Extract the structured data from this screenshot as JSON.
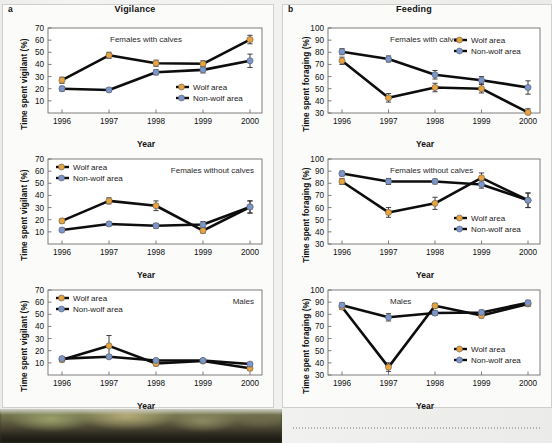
{
  "figure": {
    "columns": [
      {
        "letter": "a",
        "title": "Vigilance",
        "ylabel": "Time spent vigilant (%)",
        "xlabel": "Year"
      },
      {
        "letter": "b",
        "title": "Feeding",
        "ylabel": "Time spent foraging (%)",
        "xlabel": "Year"
      }
    ],
    "legend": {
      "wolf_label": "Wolf area",
      "nonwolf_label": "Non-wolf area",
      "wolf_color": "#e8a33d",
      "nonwolf_color": "#7b96cd",
      "line_color": "#0d0d0d"
    }
  },
  "chart_data": [
    {
      "type": "line",
      "panel": "a1",
      "title": "Vigilance",
      "annotation": "Females with calves",
      "xlabel": "Year",
      "ylabel": "Time spent vigilant (%)",
      "categories": [
        "1996",
        "1997",
        "1998",
        "1999",
        "2000"
      ],
      "x": [
        1996,
        1997,
        1998,
        1999,
        2000
      ],
      "ylim": [
        0,
        70
      ],
      "yticks": [
        10,
        20,
        30,
        40,
        50,
        60,
        70
      ],
      "grid": false,
      "legend_position": "bottom-right",
      "series": [
        {
          "name": "Wolf area",
          "color": "#e8a33d",
          "values": [
            27,
            47.5,
            41,
            40.5,
            60.5
          ],
          "errors": [
            2.5,
            2.5,
            2.5,
            2.5,
            3.5
          ]
        },
        {
          "name": "Non-wolf area",
          "color": "#7b96cd",
          "values": [
            20,
            19,
            33.5,
            35.5,
            43
          ],
          "errors": [
            2,
            1.5,
            2,
            2.5,
            5.5
          ]
        }
      ]
    },
    {
      "type": "line",
      "panel": "a2",
      "title": "Vigilance",
      "annotation": "Females without calves",
      "xlabel": "Year",
      "ylabel": "Time spent vigilant (%)",
      "categories": [
        "1996",
        "1997",
        "1998",
        "1999",
        "2000"
      ],
      "x": [
        1996,
        1997,
        1998,
        1999,
        2000
      ],
      "ylim": [
        0,
        70
      ],
      "yticks": [
        10,
        20,
        30,
        40,
        50,
        60,
        70
      ],
      "grid": false,
      "legend_position": "top-left",
      "series": [
        {
          "name": "Wolf area",
          "color": "#e8a33d",
          "values": [
            19,
            35.5,
            31.5,
            11,
            30.5
          ],
          "errors": [
            1.5,
            2.5,
            4,
            2,
            5
          ]
        },
        {
          "name": "Non-wolf area",
          "color": "#7b96cd",
          "values": [
            11.5,
            16.5,
            15,
            16,
            30.5
          ],
          "errors": [
            1.5,
            1.5,
            2,
            2.5,
            5
          ]
        }
      ]
    },
    {
      "type": "line",
      "panel": "a3",
      "title": "Vigilance",
      "annotation": "Males",
      "xlabel": "Year",
      "ylabel": "Time spent vigilant (%)",
      "categories": [
        "1996",
        "1997",
        "1998",
        "1999",
        "2000"
      ],
      "x": [
        1996,
        1997,
        1998,
        1999,
        2000
      ],
      "ylim": [
        0,
        70
      ],
      "yticks": [
        10,
        20,
        30,
        40,
        50,
        60,
        70
      ],
      "grid": false,
      "legend_position": "top-left",
      "series": [
        {
          "name": "Wolf area",
          "color": "#e8a33d",
          "values": [
            12.5,
            24,
            9.5,
            11.5,
            5.5
          ],
          "errors": [
            1.5,
            8.5,
            2,
            1.5,
            1.5
          ]
        },
        {
          "name": "Non-wolf area",
          "color": "#7b96cd",
          "values": [
            13.5,
            15,
            12,
            12,
            9
          ],
          "errors": [
            1.5,
            1.5,
            1,
            1,
            1
          ]
        }
      ]
    },
    {
      "type": "line",
      "panel": "b1",
      "title": "Feeding",
      "annotation": "Females with calves",
      "xlabel": "Year",
      "ylabel": "Time spent foraging (%)",
      "categories": [
        "1996",
        "1997",
        "1998",
        "1999",
        "2000"
      ],
      "x": [
        1996,
        1997,
        1998,
        1999,
        2000
      ],
      "ylim": [
        30,
        100
      ],
      "yticks": [
        30,
        40,
        50,
        60,
        70,
        80,
        90,
        100
      ],
      "grid": false,
      "legend_position": "top-right",
      "series": [
        {
          "name": "Wolf area",
          "color": "#e8a33d",
          "values": [
            73,
            42.5,
            51,
            50,
            30.5
          ],
          "errors": [
            3,
            3.5,
            3.5,
            3.5,
            3
          ]
        },
        {
          "name": "Non-wolf area",
          "color": "#7b96cd",
          "values": [
            80.5,
            74.5,
            61.5,
            57,
            51
          ],
          "errors": [
            2.5,
            2.5,
            3.5,
            3,
            5.5
          ]
        }
      ]
    },
    {
      "type": "line",
      "panel": "b2",
      "title": "Feeding",
      "annotation": "Females without calves",
      "xlabel": "Year",
      "ylabel": "Time spent foraging (%)",
      "categories": [
        "1996",
        "1997",
        "1998",
        "1999",
        "2000"
      ],
      "x": [
        1996,
        1997,
        1998,
        1999,
        2000
      ],
      "ylim": [
        30,
        100
      ],
      "yticks": [
        30,
        40,
        50,
        60,
        70,
        80,
        90,
        100
      ],
      "grid": false,
      "legend_position": "bottom-right",
      "series": [
        {
          "name": "Wolf area",
          "color": "#e8a33d",
          "values": [
            81.5,
            56,
            63.5,
            84.5,
            66
          ],
          "errors": [
            2.5,
            4,
            5,
            4,
            6
          ]
        },
        {
          "name": "Non-wolf area",
          "color": "#7b96cd",
          "values": [
            88,
            81.5,
            81.5,
            79,
            66
          ],
          "errors": [
            2,
            2.5,
            2,
            3,
            6
          ]
        }
      ]
    },
    {
      "type": "line",
      "panel": "b3",
      "title": "Feeding",
      "annotation": "Males",
      "xlabel": "Year",
      "ylabel": "Time spent foraging (%)",
      "categories": [
        "1996",
        "1997",
        "1998",
        "1999",
        "2000"
      ],
      "x": [
        1996,
        1997,
        1998,
        1999,
        2000
      ],
      "ylim": [
        30,
        100
      ],
      "yticks": [
        30,
        40,
        50,
        60,
        70,
        80,
        90,
        100
      ],
      "grid": false,
      "legend_position": "bottom-right",
      "series": [
        {
          "name": "Wolf area",
          "color": "#e8a33d",
          "values": [
            86,
            36.5,
            87,
            79,
            88.5
          ],
          "errors": [
            2,
            3.5,
            2,
            2,
            2
          ]
        },
        {
          "name": "Non-wolf area",
          "color": "#7b96cd",
          "values": [
            87.5,
            77.5,
            81,
            81.5,
            89.5
          ],
          "errors": [
            2,
            3,
            2,
            2,
            2
          ]
        }
      ]
    }
  ]
}
